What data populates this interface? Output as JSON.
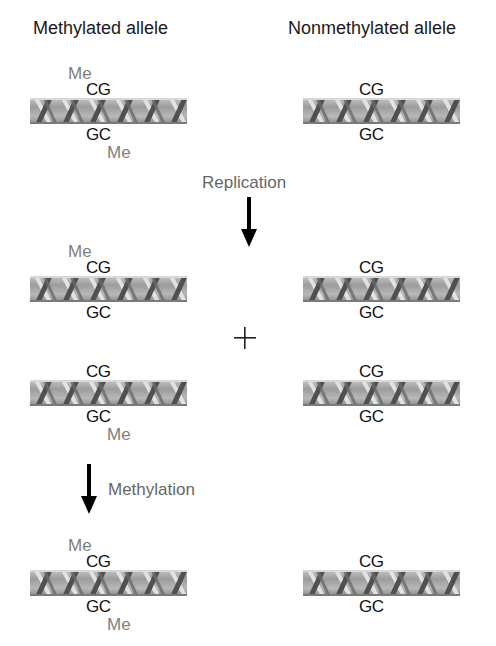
{
  "headers": {
    "left": "Methylated allele",
    "right": "Nonmethylated allele"
  },
  "rows": [
    {
      "stage": "initial",
      "left": {
        "top_base": "CG",
        "bottom_base": "GC",
        "top_me": "Me",
        "bottom_me": "Me"
      },
      "right": {
        "top_base": "CG",
        "bottom_base": "GC"
      }
    },
    {
      "stage": "after-replication-strand-1",
      "left": {
        "top_base": "CG",
        "bottom_base": "GC",
        "top_me": "Me"
      },
      "right": {
        "top_base": "CG",
        "bottom_base": "GC"
      }
    },
    {
      "stage": "after-replication-strand-2",
      "left": {
        "top_base": "CG",
        "bottom_base": "GC",
        "bottom_me": "Me"
      },
      "right": {
        "top_base": "CG",
        "bottom_base": "GC"
      }
    },
    {
      "stage": "after-methylation",
      "left": {
        "top_base": "CG",
        "bottom_base": "GC",
        "top_me": "Me",
        "bottom_me": "Me"
      },
      "right": {
        "top_base": "CG",
        "bottom_base": "GC"
      }
    }
  ],
  "steps": {
    "replication": "Replication",
    "methylation": "Methylation",
    "plus": "+"
  },
  "colors": {
    "text": "#111111",
    "methyl": "#808080",
    "step_label": "#666666",
    "helix_bg": "#a8a8a8",
    "helix_strand_dark": "#4a4a4a",
    "helix_strand_light": "#e0e0e0",
    "arrow": "#000000"
  }
}
